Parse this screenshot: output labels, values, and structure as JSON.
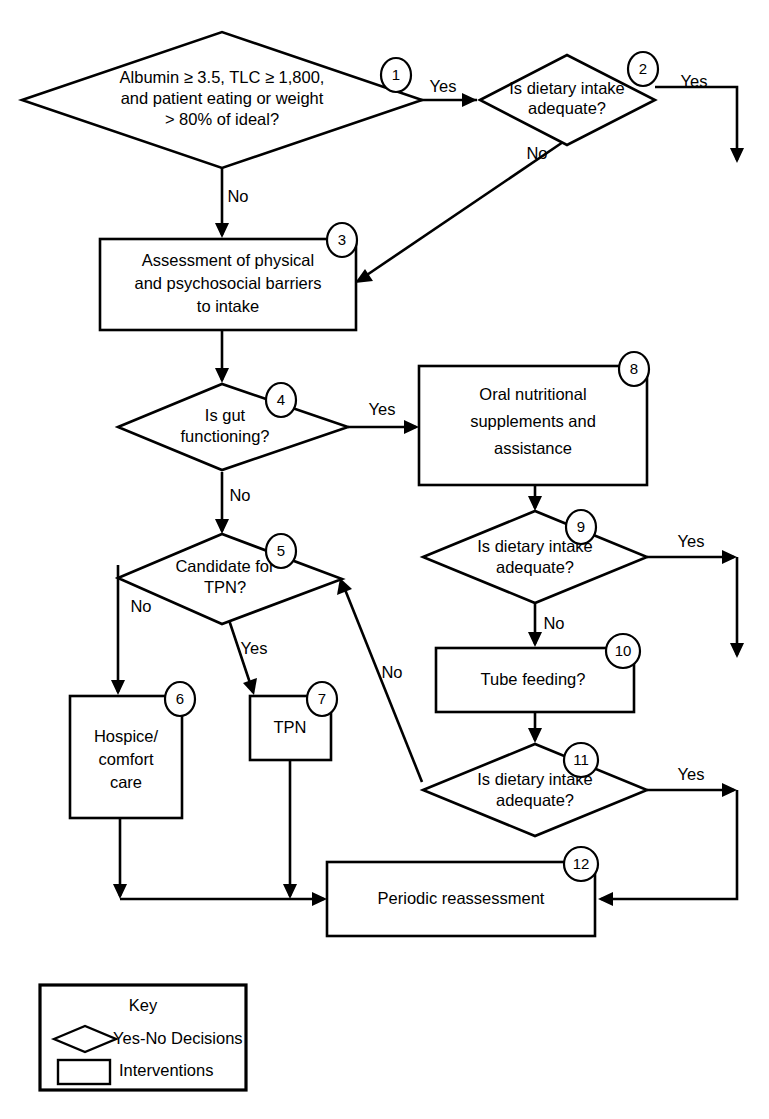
{
  "diagram": {
    "type": "flowchart",
    "background_color": "#ffffff",
    "line_color": "#000000"
  },
  "nodes": [
    {
      "id": "n1",
      "number": "1",
      "shape": "decision",
      "lines": [
        "Albumin ≥ 3.5, TLC ≥ 1,800,",
        "and patient eating or weight",
        "> 80% of ideal?"
      ]
    },
    {
      "id": "n2",
      "number": "2",
      "shape": "decision",
      "lines": [
        "Is dietary intake",
        "adequate?"
      ]
    },
    {
      "id": "n3",
      "number": "3",
      "shape": "intervention",
      "lines": [
        "Assessment of physical",
        "and psychosocial barriers",
        "to intake"
      ]
    },
    {
      "id": "n4",
      "number": "4",
      "shape": "decision",
      "lines": [
        "Is gut",
        "functioning?"
      ]
    },
    {
      "id": "n5",
      "number": "5",
      "shape": "decision",
      "lines": [
        "Candidate for",
        "TPN?"
      ]
    },
    {
      "id": "n6",
      "number": "6",
      "shape": "intervention",
      "lines": [
        "Hospice/",
        "comfort",
        "care"
      ]
    },
    {
      "id": "n7",
      "number": "7",
      "shape": "intervention",
      "lines": [
        "TPN"
      ]
    },
    {
      "id": "n8",
      "number": "8",
      "shape": "intervention",
      "lines": [
        "Oral nutritional",
        "supplements and",
        "assistance"
      ]
    },
    {
      "id": "n9",
      "number": "9",
      "shape": "decision",
      "lines": [
        "Is dietary intake",
        "adequate?"
      ]
    },
    {
      "id": "n10",
      "number": "10",
      "shape": "intervention",
      "lines": [
        "Tube feeding?"
      ]
    },
    {
      "id": "n11",
      "number": "11",
      "shape": "decision",
      "lines": [
        "Is dietary intake",
        "adequate?"
      ]
    },
    {
      "id": "n12",
      "number": "12",
      "shape": "intervention",
      "lines": [
        "Periodic reassessment"
      ]
    }
  ],
  "edge_labels": {
    "e1_yes": "Yes",
    "e1_no": "No",
    "e2_yes": "Yes",
    "e2_no": "No",
    "e4_yes": "Yes",
    "e4_no": "No",
    "e5_no": "No",
    "e5_yes": "Yes",
    "e9_yes": "Yes",
    "e9_no": "No",
    "e11_yes": "Yes",
    "e11_no": "No"
  },
  "key": {
    "title": "Key",
    "decision_label": "Yes-No Decisions",
    "intervention_label": "Interventions"
  }
}
